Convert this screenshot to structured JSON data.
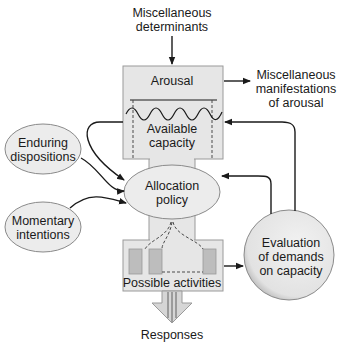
{
  "diagram": {
    "type": "flow-model",
    "colors": {
      "box_fill": "#e6e6e6",
      "ellipse_fill": "#ececec",
      "bar_fill": "#bdbdbd",
      "stroke": "#1a1a1a",
      "outline": "#9a9a9a"
    },
    "nodes": {
      "misc_determinants": {
        "line1": "Miscellaneous",
        "line2": "determinants"
      },
      "arousal": {
        "label": "Arousal"
      },
      "misc_manifestations": {
        "line1": "Miscellaneous",
        "line2": "manifestations",
        "line3": "of arousal"
      },
      "available_capacity": {
        "line1": "Available",
        "line2": "capacity"
      },
      "enduring_dispositions": {
        "line1": "Enduring",
        "line2": "dispositions"
      },
      "momentary_intentions": {
        "line1": "Momentary",
        "line2": "intentions"
      },
      "allocation_policy": {
        "line1": "Allocation",
        "line2": "policy"
      },
      "evaluation": {
        "line1": "Evaluation",
        "line2": "of demands",
        "line3": "on capacity"
      },
      "possible_activities": {
        "label": "Possible activities"
      },
      "responses": {
        "label": "Responses"
      }
    },
    "edges": [
      {
        "from": "Miscellaneous determinants",
        "to": "Arousal"
      },
      {
        "from": "Arousal",
        "to": "Miscellaneous manifestations of arousal"
      },
      {
        "from": "Available capacity",
        "to": "Allocation policy"
      },
      {
        "from": "Enduring dispositions",
        "to": "Allocation policy"
      },
      {
        "from": "Momentary intentions",
        "to": "Allocation policy"
      },
      {
        "from": "Allocation policy",
        "to": "Possible activities"
      },
      {
        "from": "Possible activities",
        "to": "Evaluation of demands on capacity"
      },
      {
        "from": "Evaluation of demands on capacity",
        "to": "Allocation policy"
      },
      {
        "from": "Evaluation of demands on capacity",
        "to": "Available capacity"
      },
      {
        "from": "Possible activities",
        "to": "Responses"
      }
    ]
  }
}
